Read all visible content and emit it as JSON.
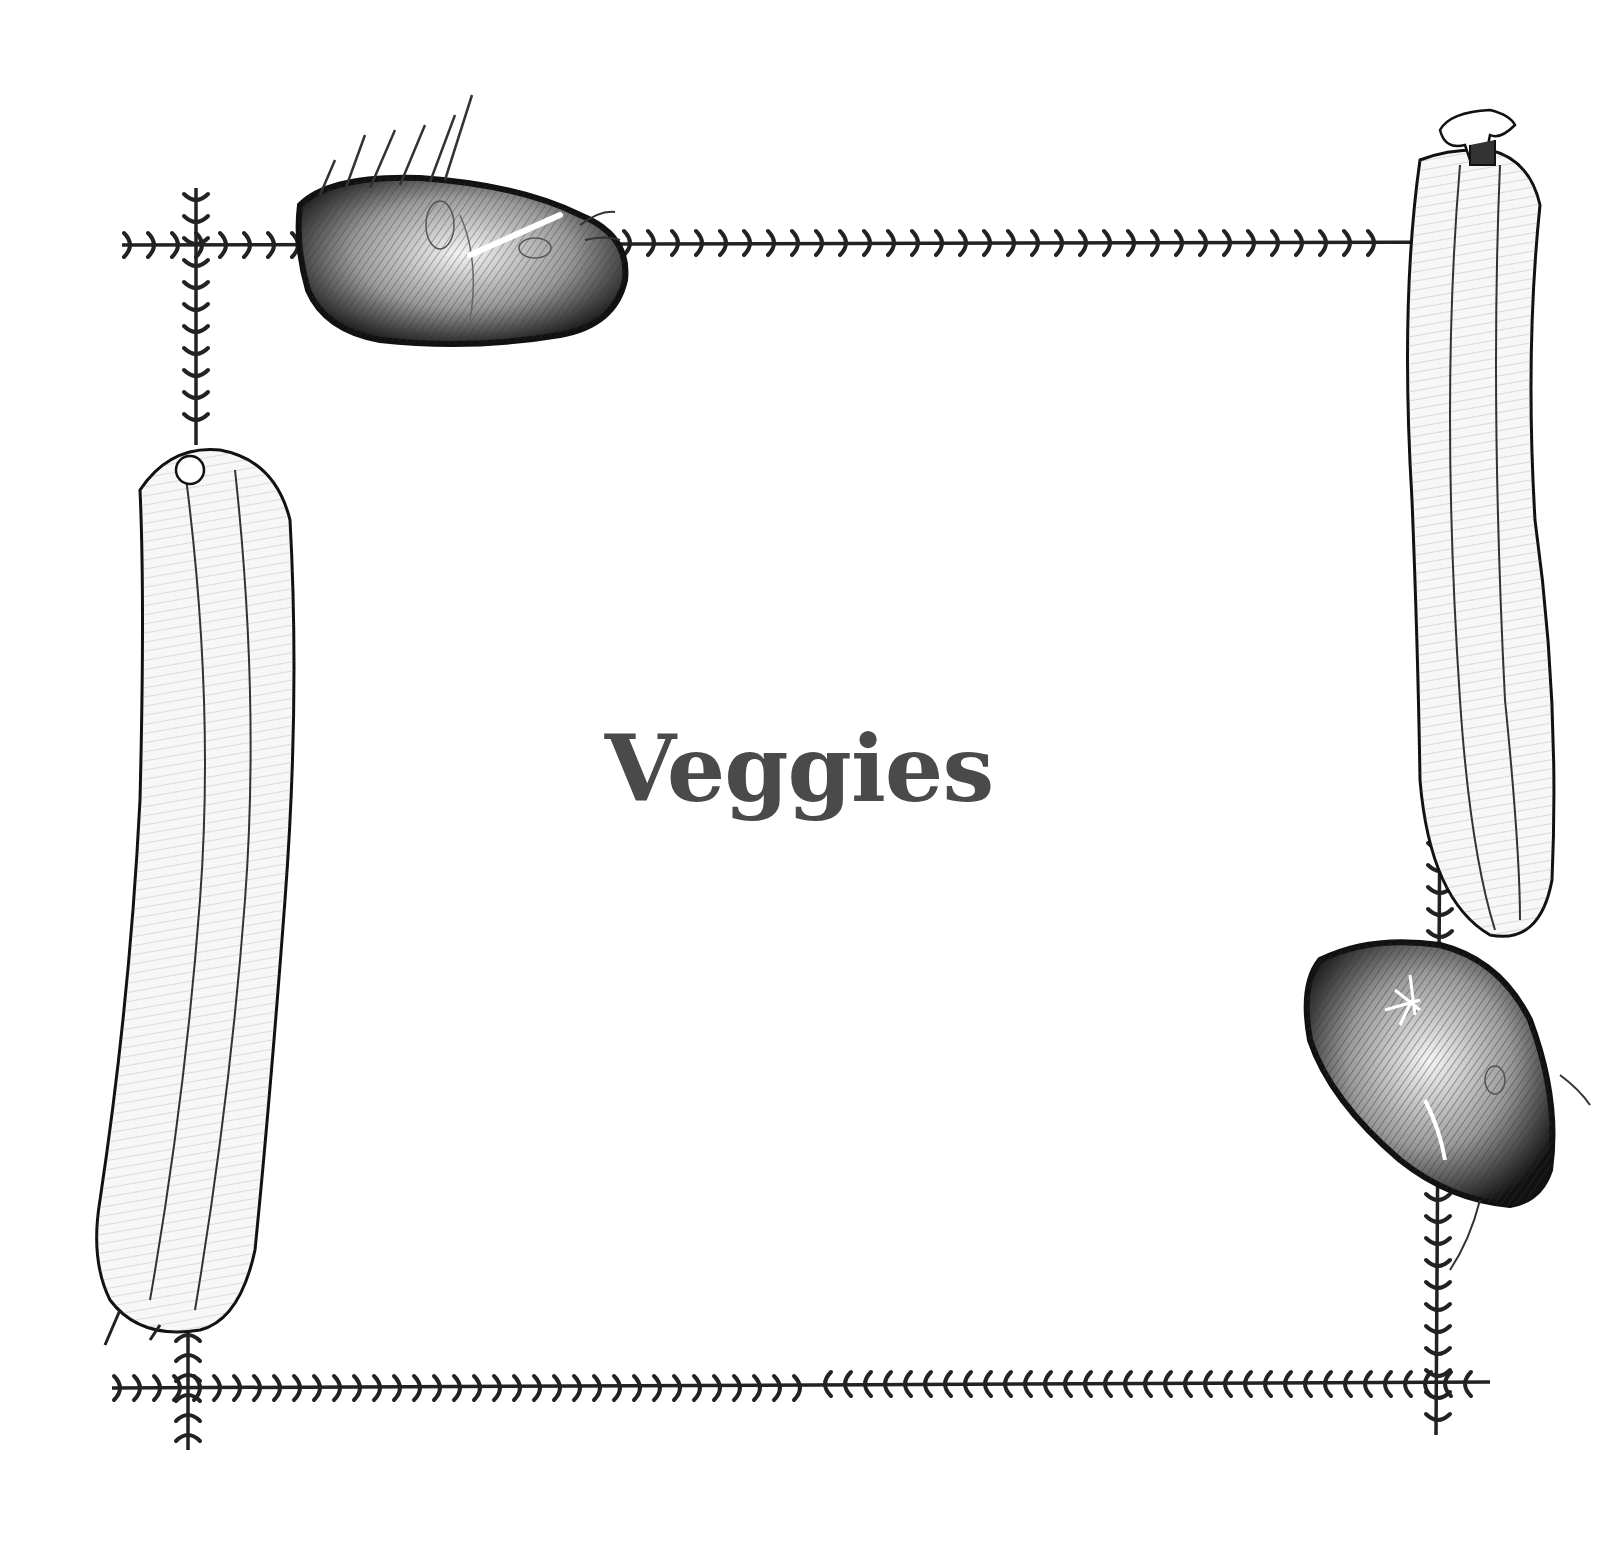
{
  "page": {
    "title": "Veggies",
    "title_color": "#4a4a4a",
    "ink_color": "#1a1a1a",
    "background": "#ffffff"
  },
  "illustrations": [
    {
      "name": "potato",
      "position": "top-left"
    },
    {
      "name": "zucchini",
      "position": "top-right"
    },
    {
      "name": "zucchini",
      "position": "left"
    },
    {
      "name": "potato",
      "position": "bottom-right"
    }
  ],
  "border": {
    "style": "vine-with-hooks",
    "corners": 4
  }
}
